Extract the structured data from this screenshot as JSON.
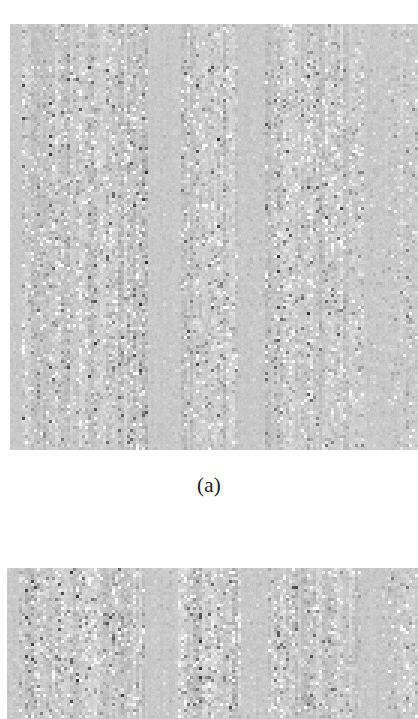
{
  "figure": {
    "background_color": "#ffffff",
    "width": 418,
    "height": 719,
    "captions": {
      "panel_a": "(a)"
    }
  },
  "chart_data": [
    {
      "type": "heatmap",
      "name": "panel-a-matrix",
      "title": "",
      "subtitle": "",
      "caption": "(a)",
      "xlabel": "",
      "ylabel": "",
      "colormap": "gray",
      "grid": false,
      "legend": null,
      "axis_ticks_visible": false,
      "axis_labels_visible": false,
      "frame_visible": false,
      "value_range": [
        0,
        1
      ],
      "background_value": 0.79,
      "cell_size_px": 3,
      "rows": 142,
      "cols": 136,
      "plot_box_px": {
        "x": 10,
        "y": 24,
        "width": 408,
        "height": 426
      },
      "column_bands": [
        {
          "start_col": 0,
          "end_col": 4,
          "activity": 0.1,
          "label": "quiet"
        },
        {
          "start_col": 4,
          "end_col": 46,
          "activity": 0.95,
          "label": "active-band-1"
        },
        {
          "start_col": 46,
          "end_col": 57,
          "activity": 0.16,
          "label": "gap-1"
        },
        {
          "start_col": 57,
          "end_col": 76,
          "activity": 1.0,
          "label": "active-band-2"
        },
        {
          "start_col": 76,
          "end_col": 85,
          "activity": 0.12,
          "label": "gap-2"
        },
        {
          "start_col": 85,
          "end_col": 118,
          "activity": 0.9,
          "label": "active-band-3"
        },
        {
          "start_col": 118,
          "end_col": 126,
          "activity": 0.2,
          "label": "gap-3"
        },
        {
          "start_col": 126,
          "end_col": 136,
          "activity": 0.55,
          "label": "active-band-4"
        }
      ],
      "row_bands": [
        {
          "start_row": 0,
          "end_row": 14,
          "activity": 0.55
        },
        {
          "start_row": 14,
          "end_row": 120,
          "activity": 1.0
        },
        {
          "start_row": 120,
          "end_row": 142,
          "activity": 0.8
        }
      ],
      "noise_seed": 20250614,
      "notes": "Dense grayscale matrix of residual/coefficient magnitudes; vertical striping from column-wise structure."
    },
    {
      "type": "heatmap",
      "name": "panel-b-matrix",
      "title": "",
      "subtitle": "",
      "caption": "",
      "xlabel": "",
      "ylabel": "",
      "colormap": "gray",
      "grid": false,
      "legend": null,
      "axis_ticks_visible": false,
      "axis_labels_visible": false,
      "frame_visible": false,
      "value_range": [
        0,
        1
      ],
      "background_value": 0.79,
      "cell_size_px": 3,
      "rows": 50,
      "cols": 137,
      "plot_box_px": {
        "x": 7,
        "y": 568,
        "width": 411,
        "height": 151
      },
      "column_bands": [
        {
          "start_col": 0,
          "end_col": 4,
          "activity": 0.12,
          "label": "quiet"
        },
        {
          "start_col": 4,
          "end_col": 46,
          "activity": 0.95,
          "label": "active-band-1"
        },
        {
          "start_col": 46,
          "end_col": 57,
          "activity": 0.18,
          "label": "gap-1"
        },
        {
          "start_col": 57,
          "end_col": 78,
          "activity": 1.0,
          "label": "active-band-2"
        },
        {
          "start_col": 78,
          "end_col": 87,
          "activity": 0.14,
          "label": "gap-2"
        },
        {
          "start_col": 87,
          "end_col": 118,
          "activity": 0.9,
          "label": "active-band-3"
        },
        {
          "start_col": 118,
          "end_col": 127,
          "activity": 0.2,
          "label": "gap-3"
        },
        {
          "start_col": 127,
          "end_col": 137,
          "activity": 0.6,
          "label": "active-band-4"
        }
      ],
      "row_bands": [
        {
          "start_row": 0,
          "end_row": 50,
          "activity": 1.0
        }
      ],
      "noise_seed": 70112233,
      "notes": "Second (cropped) grayscale matrix panel, same column banding as panel (a)."
    }
  ]
}
